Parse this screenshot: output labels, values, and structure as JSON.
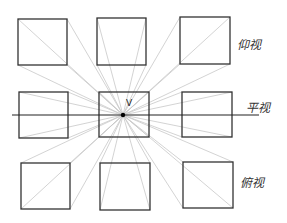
{
  "diagram": {
    "vanishing_point": {
      "label": "V",
      "x": 123,
      "y": 115
    },
    "horizon": {
      "label": "平视",
      "y": 115,
      "x1": 12,
      "x2": 259
    },
    "labels": {
      "top": "仰视",
      "middle": "平视",
      "bottom": "俯视"
    },
    "squares": [
      {
        "id": "top-left",
        "x": 18,
        "y": 19,
        "w": 49,
        "h": 46
      },
      {
        "id": "top-center",
        "x": 97,
        "y": 18,
        "w": 49,
        "h": 47
      },
      {
        "id": "top-right",
        "x": 180,
        "y": 17,
        "w": 50,
        "h": 47
      },
      {
        "id": "middle-left",
        "x": 19,
        "y": 92,
        "w": 49,
        "h": 46
      },
      {
        "id": "middle-center",
        "x": 99,
        "y": 92,
        "w": 50,
        "h": 45
      },
      {
        "id": "middle-right",
        "x": 182,
        "y": 92,
        "w": 50,
        "h": 45
      },
      {
        "id": "bottom-left",
        "x": 21,
        "y": 163,
        "w": 49,
        "h": 46
      },
      {
        "id": "bottom-center",
        "x": 100,
        "y": 163,
        "w": 50,
        "h": 47
      },
      {
        "id": "bottom-right",
        "x": 183,
        "y": 162,
        "w": 50,
        "h": 46
      }
    ],
    "colors": {
      "square_stroke": "#333333",
      "construction_line": "#c8c8c8",
      "horizon_line": "#222222",
      "vanishing_point": "#000000"
    }
  }
}
